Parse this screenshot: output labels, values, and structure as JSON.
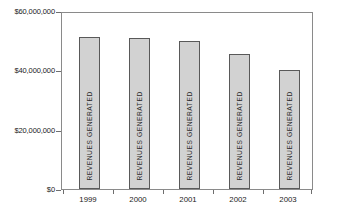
{
  "chart_data": {
    "type": "bar",
    "title": "",
    "subtitle": "",
    "xlabel": "",
    "ylabel": "",
    "categories": [
      "1999",
      "2000",
      "2001",
      "2002",
      "2003"
    ],
    "values": [
      51200000,
      50900000,
      49900000,
      45500000,
      40000000
    ],
    "bar_labels": [
      "REVENUES GENERATED",
      "REVENUES GENERATED",
      "REVENUES GENERATED",
      "REVENUES GENERATED",
      "REVENUES GENERATED"
    ],
    "series": [
      {
        "name": "REVENUES GENERATED",
        "values": [
          51200000,
          50900000,
          49900000,
          45500000,
          40000000
        ]
      }
    ],
    "ylim": [
      0,
      60000000
    ],
    "ytick_values": [
      0,
      20000000,
      40000000,
      60000000
    ],
    "ytick_labels": [
      "$0",
      "$20,000,000",
      "$40,000,000",
      "$60,000,000"
    ],
    "grid": false,
    "legend": "none",
    "colors": {
      "bar_fill": "#d2d2d2",
      "bar_border": "#595959",
      "axis": "#8a8a8a",
      "text": "#1a1a1a",
      "background": "#ffffff"
    }
  }
}
